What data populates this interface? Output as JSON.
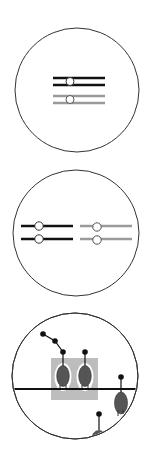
{
  "colors": {
    "background": "#ffffff",
    "outline": "#333333",
    "black_bar": "#111111",
    "gray_bar": "#9a9a9a",
    "knob_fill": "#ffffff",
    "highlight_box": "#bdbdbd",
    "ellipse_fill": "#555555",
    "dot": "#111111"
  },
  "panels": [
    {
      "id": "panel-1",
      "description": "single paired bars with knobs (black over gray)",
      "circle": {
        "cx": 77,
        "cy": 90,
        "r": 62
      },
      "bars": [
        {
          "color": "black",
          "y_top": 78,
          "y_bottom": 85,
          "x1": 53,
          "x2": 105,
          "knob_x": 70
        },
        {
          "color": "gray",
          "y_top": 96,
          "y_bottom": 103,
          "x1": 53,
          "x2": 105,
          "knob_x": 70
        }
      ]
    },
    {
      "id": "panel-2",
      "description": "split bars: black pair left, gray pair right",
      "circle": {
        "cx": 76,
        "cy": 233,
        "r": 63
      },
      "bars": [
        {
          "color": "black",
          "y": 226,
          "x1": 21,
          "x2": 73,
          "knob_x": 39
        },
        {
          "color": "black",
          "y": 239,
          "x1": 21,
          "x2": 73,
          "knob_x": 39
        },
        {
          "color": "gray",
          "y": 226,
          "x1": 80,
          "x2": 132,
          "knob_x": 97
        },
        {
          "color": "gray",
          "y": 239,
          "x1": 80,
          "x2": 132,
          "knob_x": 97
        }
      ]
    },
    {
      "id": "panel-3",
      "description": "attached ellipses on horizontal line with highlighted pair",
      "circle": {
        "cx": 75,
        "cy": 376,
        "r": 63
      },
      "line_y": 389
    }
  ]
}
